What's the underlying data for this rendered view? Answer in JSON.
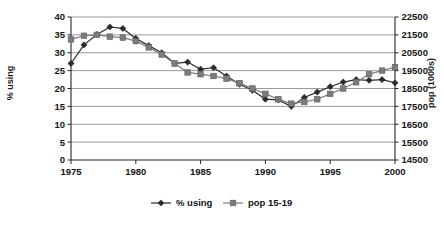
{
  "chart_data": {
    "type": "line",
    "title": "",
    "xlabel": "",
    "ylabel": "% using",
    "ylabel_secondary": "pop (1000s)",
    "grid": true,
    "legend_position": "bottom",
    "xlim": [
      1975,
      2000
    ],
    "xticks": [
      1975,
      1980,
      1985,
      1990,
      1995,
      2000
    ],
    "ylim": [
      0,
      40
    ],
    "yticks": [
      0,
      5,
      10,
      15,
      20,
      25,
      30,
      35,
      40
    ],
    "ylim_secondary": [
      14500,
      22500
    ],
    "yticks_secondary": [
      14500,
      15500,
      16500,
      17500,
      18500,
      19500,
      20500,
      21500,
      22500
    ],
    "x": [
      1975,
      1976,
      1977,
      1978,
      1979,
      1980,
      1981,
      1982,
      1983,
      1984,
      1985,
      1986,
      1987,
      1988,
      1989,
      1990,
      1991,
      1992,
      1993,
      1994,
      1995,
      1996,
      1997,
      1998,
      1999,
      2000
    ],
    "series": [
      {
        "name": "% using",
        "axis": "left",
        "marker": "diamond",
        "color": "#2b2b2b",
        "values": [
          27.0,
          32.2,
          35.1,
          37.2,
          36.8,
          34.0,
          32.0,
          30.0,
          27.0,
          27.4,
          25.4,
          25.8,
          23.5,
          21.2,
          19.5,
          17.0,
          16.8,
          15.0,
          17.5,
          19.0,
          20.5,
          21.8,
          22.5,
          22.3,
          22.5,
          21.6
        ]
      },
      {
        "name": "pop 15-19",
        "axis": "right",
        "marker": "square",
        "color": "#7c7c7c",
        "values": [
          21250,
          21450,
          21500,
          21400,
          21350,
          21150,
          20800,
          20400,
          19900,
          19400,
          19300,
          19200,
          19050,
          18800,
          18500,
          18200,
          17900,
          17650,
          17750,
          17900,
          18200,
          18500,
          18850,
          19300,
          19500,
          19700
        ]
      }
    ]
  },
  "legend": {
    "items": [
      {
        "label": "% using",
        "marker": "diamond",
        "color": "#2b2b2b"
      },
      {
        "label": "pop 15-19",
        "marker": "square",
        "color": "#7c7c7c"
      }
    ]
  },
  "axes": {
    "left_title": "% using",
    "right_title": "pop (1000s)"
  }
}
